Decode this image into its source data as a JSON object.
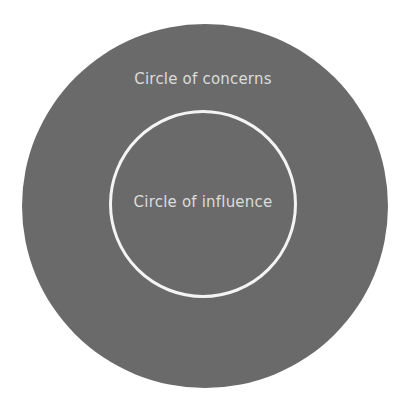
{
  "diagram": {
    "type": "nested-circles",
    "outer_circle": {
      "label": "Circle of concerns",
      "fill": "#6a6a6a"
    },
    "inner_circle": {
      "label": "Circle of influence",
      "stroke": "#f4f4f4"
    },
    "text_color": "#dcdcdc",
    "background": "#ffffff"
  }
}
